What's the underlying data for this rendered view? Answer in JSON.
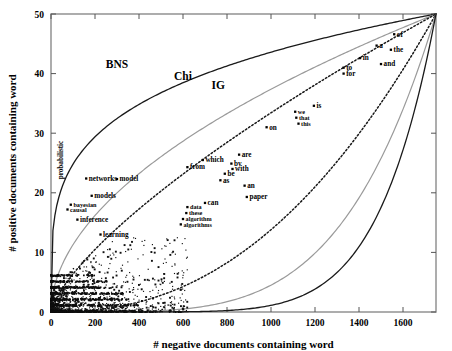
{
  "chart_data": {
    "type": "scatter",
    "title": "",
    "xlabel": "# negative documents containing word",
    "ylabel": "# positive documents containing word",
    "xlim": [
      0,
      1750
    ],
    "ylim": [
      0,
      50
    ],
    "xticks": [
      0,
      200,
      400,
      600,
      800,
      1000,
      1200,
      1400,
      1600
    ],
    "xticklabels": [
      "0",
      "200",
      "400",
      "600",
      "800",
      "1000",
      "1200",
      "1400",
      "1600"
    ],
    "yticks": [
      0,
      10,
      20,
      30,
      40,
      50
    ],
    "yticklabels": [
      "0",
      "10",
      "20",
      "30",
      "40",
      "50"
    ],
    "grid": false,
    "legend_position": "inline-curve-labels",
    "curve_labels": [
      {
        "name": "BNS",
        "text": "BNS",
        "x": 300,
        "y": 41.0,
        "style": "solid-black"
      },
      {
        "name": "Chi",
        "text": "Chi",
        "x": 600,
        "y": 39.0,
        "style": "solid-gray"
      },
      {
        "name": "IG",
        "text": "IG",
        "x": 760,
        "y": 37.5,
        "style": "dotted-black"
      }
    ],
    "series": [
      {
        "name": "labeled-words",
        "type": "scatter",
        "points": [
          {
            "label": "of",
            "x": 1560,
            "y": 46.6
          },
          {
            "label": "a",
            "x": 1480,
            "y": 44.7
          },
          {
            "label": "the",
            "x": 1545,
            "y": 44.0
          },
          {
            "label": "in",
            "x": 1405,
            "y": 42.6
          },
          {
            "label": "and",
            "x": 1500,
            "y": 41.6
          },
          {
            "label": "to",
            "x": 1330,
            "y": 41.0
          },
          {
            "label": "for",
            "x": 1330,
            "y": 40.0
          },
          {
            "label": "is",
            "x": 1195,
            "y": 34.6
          },
          {
            "label": "we",
            "x": 1110,
            "y": 33.6
          },
          {
            "label": "that",
            "x": 1115,
            "y": 32.6
          },
          {
            "label": "this",
            "x": 1125,
            "y": 31.6
          },
          {
            "label": "on",
            "x": 980,
            "y": 31.0
          },
          {
            "label": "are",
            "x": 855,
            "y": 26.4
          },
          {
            "label": "by",
            "x": 820,
            "y": 24.9
          },
          {
            "label": "with",
            "x": 825,
            "y": 24.0
          },
          {
            "label": "which",
            "x": 690,
            "y": 25.5
          },
          {
            "label": "from",
            "x": 620,
            "y": 24.3
          },
          {
            "label": "be",
            "x": 790,
            "y": 23.2
          },
          {
            "label": "as",
            "x": 770,
            "y": 22.1
          },
          {
            "label": "an",
            "x": 880,
            "y": 21.2
          },
          {
            "label": "paper",
            "x": 890,
            "y": 19.3
          },
          {
            "label": "can",
            "x": 700,
            "y": 18.3
          },
          {
            "label": "data",
            "x": 620,
            "y": 17.6
          },
          {
            "label": "these",
            "x": 615,
            "y": 16.6
          },
          {
            "label": "algorithm",
            "x": 600,
            "y": 15.6
          },
          {
            "label": "algorithms",
            "x": 590,
            "y": 14.7
          },
          {
            "label": "networks",
            "x": 160,
            "y": 22.4
          },
          {
            "label": "model",
            "x": 300,
            "y": 22.3
          },
          {
            "label": "probabilistic",
            "x": 55,
            "y": 25.5
          },
          {
            "label": "models",
            "x": 185,
            "y": 19.5
          },
          {
            "label": "bayesian",
            "x": 90,
            "y": 18.0
          },
          {
            "label": "causal",
            "x": 75,
            "y": 17.2
          },
          {
            "label": "inference",
            "x": 120,
            "y": 15.5
          },
          {
            "label": "learning",
            "x": 225,
            "y": 13.0
          }
        ]
      },
      {
        "name": "unlabeled-words",
        "type": "scatter",
        "description": "dense cloud of small points concentrated near the origin"
      }
    ],
    "curves": [
      {
        "name": "BNS",
        "description": "outermost solid black curve, rises steeply from origin region and converges at upper-right corner"
      },
      {
        "name": "Chi",
        "description": "gray solid curve between BNS and IG"
      },
      {
        "name": "IG",
        "description": "dotted black curve"
      },
      {
        "name": "IG-lower",
        "description": "lower dotted black curve, mirror of IG"
      },
      {
        "name": "Chi-lower",
        "description": "lower gray solid curve"
      },
      {
        "name": "BNS-lower",
        "description": "lower solid black curve"
      }
    ]
  }
}
